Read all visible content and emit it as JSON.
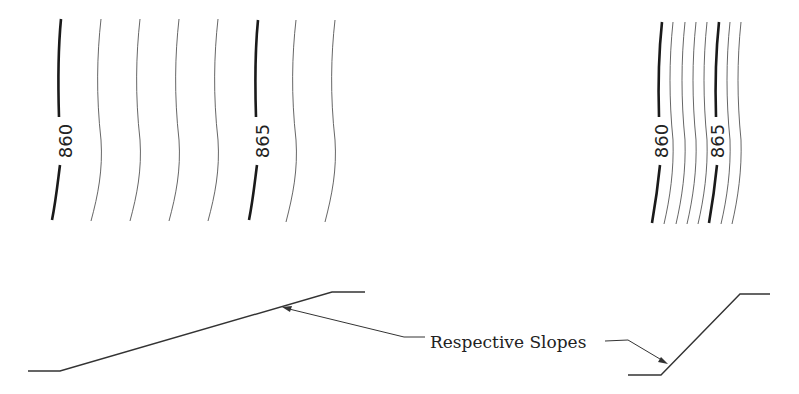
{
  "diagram": {
    "left_panel": {
      "description": "gentle slope - widely spaced contours",
      "contour_labels": [
        "860",
        "865"
      ]
    },
    "right_panel": {
      "description": "steep slope - closely spaced contours",
      "contour_labels": [
        "860",
        "865"
      ]
    },
    "annotation": {
      "label": "Respective Slopes"
    }
  }
}
